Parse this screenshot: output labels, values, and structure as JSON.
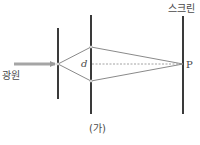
{
  "diagram": {
    "caption": "(가)",
    "labels": {
      "source": "광원",
      "screen": "스크린",
      "slit_separation": "d",
      "point": "P"
    },
    "colors": {
      "barrier": "#3a3a3a",
      "ray": "#8a8a8a",
      "arrow": "#9a9a9a",
      "dashed": "#8a8a8a",
      "text": "#4a4a4a"
    },
    "elements": {
      "single_slit_barrier": {
        "x": 58,
        "y1": 28,
        "y2": 99
      },
      "double_slit_barrier": {
        "x": 91,
        "y1": 15,
        "y2": 114
      },
      "screen": {
        "x": 183,
        "y1": 16,
        "y2": 114
      },
      "single_slit": {
        "x": 58,
        "y": 64
      },
      "slit_top": {
        "x": 91,
        "y": 47
      },
      "slit_bottom": {
        "x": 91,
        "y": 81
      },
      "point_P": {
        "x": 183,
        "y": 64
      },
      "source_arrow": {
        "x1": 14,
        "x2": 57,
        "y": 64
      }
    }
  }
}
